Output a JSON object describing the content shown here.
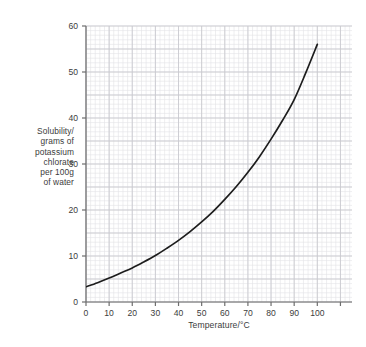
{
  "chart_data": {
    "type": "line",
    "title": "",
    "xlabel": "Temperature/°C",
    "ylabel": "Solubility/ grams of potassium chlorate per 100g of water",
    "ylabel_lines": [
      "Solubility/",
      "grams of",
      "potassium",
      "chlorate",
      "per 100g",
      "of water"
    ],
    "xlim": [
      0,
      115
    ],
    "ylim": [
      0,
      60
    ],
    "xticks": [
      0,
      10,
      20,
      30,
      40,
      50,
      60,
      70,
      80,
      90,
      100
    ],
    "xtick_labels": [
      "0",
      "10",
      "20",
      "30",
      "40",
      "50",
      "60",
      "70",
      "80",
      "90",
      "100"
    ],
    "yticks": [
      0,
      10,
      20,
      30,
      40,
      50,
      60
    ],
    "ytick_labels": [
      "0",
      "10",
      "20",
      "30",
      "40",
      "50",
      "60"
    ],
    "grid": true,
    "grid_minor_step_x": 2,
    "grid_minor_step_y": 1,
    "grid_major_step_x": 10,
    "grid_major_step_y": 5,
    "legend": false,
    "series": [
      {
        "name": "potassium chlorate solubility",
        "x": [
          0,
          5,
          10,
          15,
          20,
          25,
          30,
          35,
          40,
          45,
          50,
          55,
          60,
          65,
          70,
          75,
          80,
          85,
          90,
          95,
          100
        ],
        "values": [
          3.3,
          4.2,
          5.2,
          6.3,
          7.4,
          8.7,
          10.1,
          11.7,
          13.4,
          15.3,
          17.4,
          19.7,
          22.3,
          25.1,
          28.2,
          31.6,
          35.4,
          39.5,
          44.0,
          49.8,
          56.0
        ]
      }
    ],
    "colors": {
      "curve": "#1d1d1d",
      "axis": "#6e6e6e",
      "grid_minor": "#e2e2e6",
      "grid_major": "#c9c9cf",
      "background": "#ffffff",
      "text": "#3c3c3c"
    }
  }
}
